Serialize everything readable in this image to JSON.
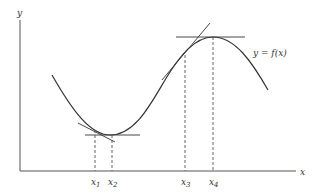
{
  "diagram": {
    "axes": {
      "y_label": "y",
      "x_label": "x"
    },
    "curve_label": "y = f(x)",
    "points": [
      {
        "name": "x",
        "sub": "1",
        "x": 95
      },
      {
        "name": "x",
        "sub": "2",
        "x": 112
      },
      {
        "name": "x",
        "sub": "3",
        "x": 185
      },
      {
        "name": "x",
        "sub": "4",
        "x": 213
      }
    ],
    "colors": {
      "line": "#333333",
      "axis": "#555555"
    }
  }
}
